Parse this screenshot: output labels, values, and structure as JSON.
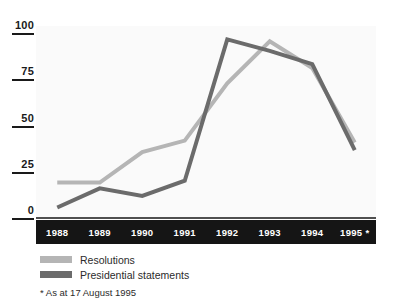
{
  "chart_data": {
    "type": "line",
    "title": "",
    "subtitle": "",
    "xlabel": "",
    "ylabel": "",
    "categories": [
      "1988",
      "1989",
      "1990",
      "1991",
      "1992",
      "1993",
      "1994",
      "1995 *"
    ],
    "x_tick_labels": [
      "1988",
      "1989",
      "1990",
      "1991",
      "1992",
      "1993",
      "1994",
      "1995 *"
    ],
    "y_tick_labels": [
      "100",
      "75",
      "50",
      "25",
      "0"
    ],
    "y_ticks": [
      100,
      75,
      50,
      25,
      0
    ],
    "ylim": [
      0,
      100
    ],
    "grid": false,
    "legend_position": "below-left",
    "series": [
      {
        "name": "Resolutions",
        "color": "#b5b5b5",
        "values": [
          18,
          18,
          34,
          40,
          70,
          92,
          78,
          39
        ]
      },
      {
        "name": "Presidential statements",
        "color": "#6b6b6b",
        "values": [
          5,
          15,
          11,
          19,
          93,
          87,
          80,
          35
        ]
      }
    ],
    "annotations": [
      "* As at 17 August 1995"
    ]
  },
  "legend": {
    "items": [
      {
        "label": "Resolutions",
        "swatch_color": "#b5b5b5"
      },
      {
        "label": "Presidential statements",
        "swatch_color": "#6b6b6b"
      }
    ]
  },
  "footnote": {
    "text": "* As at 17 August 1995"
  },
  "axes": {
    "y_labels": [
      "100",
      "75",
      "50",
      "25",
      "0"
    ],
    "x_labels": [
      "1988",
      "1989",
      "1990",
      "1991",
      "1992",
      "1993",
      "1994",
      "1995 *"
    ],
    "axis_band_color": "#151515",
    "tick_text_color": "#1a1a1a",
    "x_label_color": "#ffffff"
  }
}
